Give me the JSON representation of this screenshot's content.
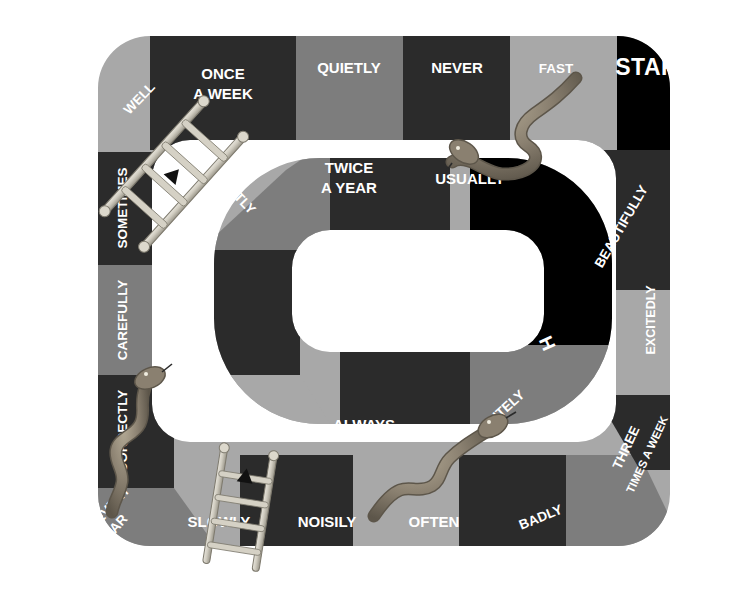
{
  "board": {
    "title": "Adverbs of Manner and Frequency Snakes and Ladders Board Game",
    "colors": {
      "dark": "#2b2b2b",
      "medium": "#7d7d7d",
      "light": "#a8a8a8",
      "black": "#000000",
      "text": "#ffffff",
      "background": "#ffffff",
      "snake_body": "#8a8070",
      "ladder": "#c8c4b8"
    },
    "start_label": "START",
    "finish_label": "FINISH"
  },
  "outer_track": {
    "top_row": [
      {
        "label": "WELL",
        "shade": "light"
      },
      {
        "label": "ONCE\nA WEEK",
        "shade": "dark"
      },
      {
        "label": "QUIETLY",
        "shade": "medium"
      },
      {
        "label": "NEVER",
        "shade": "dark"
      },
      {
        "label": "FAST",
        "shade": "light"
      },
      {
        "label": "START",
        "shade": "black"
      }
    ],
    "left_column": [
      {
        "label": "SOMETIMES",
        "shade": "dark"
      },
      {
        "label": "CAREFULLY",
        "shade": "medium"
      },
      {
        "label": "CORRECTLY",
        "shade": "dark"
      },
      {
        "label": "EVERY\nYEAR",
        "shade": "medium"
      }
    ],
    "bottom_row": [
      {
        "label": "SLOWLY",
        "shade": "dark"
      },
      {
        "label": "NOISILY",
        "shade": "light"
      },
      {
        "label": "OFTEN",
        "shade": "dark"
      },
      {
        "label": "BADLY",
        "shade": "medium"
      }
    ],
    "right_column": [
      {
        "label": "BEAUTIFULLY",
        "shade": "dark"
      },
      {
        "label": "EXCITEDLY",
        "shade": "light"
      },
      {
        "label": "THREE\nTIMES A WEEK",
        "shade": "dark"
      }
    ]
  },
  "inner_track": {
    "segments": [
      {
        "label": "SECRETLY",
        "shade": "medium"
      },
      {
        "label": "TWICE\nA YEAR",
        "shade": "dark"
      },
      {
        "label": "USUALLY",
        "shade": "light"
      },
      {
        "label": "ONCE\nA MONTH",
        "shade": "dark"
      },
      {
        "label": "CLEARLY",
        "shade": "light"
      },
      {
        "label": "ALWAYS",
        "shade": "dark"
      },
      {
        "label": "POLITELY",
        "shade": "medium"
      },
      {
        "label": "FINISH",
        "shade": "black"
      }
    ]
  },
  "pieces": {
    "ladders": [
      {
        "name": "ladder-secretly-to-well",
        "from": "SECRETLY",
        "to": "WELL",
        "arrow": "up-left"
      },
      {
        "name": "ladder-slowly-to-clearly",
        "from": "SLOWLY",
        "to": "CLEARLY",
        "arrow": "up"
      }
    ],
    "snakes": [
      {
        "name": "snake-fast-to-usually",
        "tail": "FAST",
        "head": "USUALLY"
      },
      {
        "name": "snake-once-a-month-to-every-year",
        "head": "ONCE A MONTH",
        "tail": "EVERY YEAR"
      },
      {
        "name": "snake-politely-to-often",
        "head": "POLITELY",
        "tail": "OFTEN"
      }
    ]
  },
  "text_labels": {
    "well": "WELL",
    "once_a_week_l1": "ONCE",
    "once_a_week_l2": "A WEEK",
    "quietly": "QUIETLY",
    "never": "NEVER",
    "fast": "FAST",
    "start": "START",
    "sometimes": "SOMETIMES",
    "carefully": "CAREFULLY",
    "correctly": "CORRECTLY",
    "every": "EVERY",
    "year": "YEAR",
    "slowly": "SLOWLY",
    "noisily": "NOISILY",
    "often": "OFTEN",
    "badly": "BADLY",
    "three": "THREE",
    "times_a_week": "TIMES A WEEK",
    "excitedly": "EXCITEDLY",
    "beautifully": "BEAUTIFULLY",
    "secretly": "SECRETLY",
    "twice": "TWICE",
    "a_year": "A YEAR",
    "usually": "USUALLY",
    "once": "ONCE",
    "a_month": "A MONTH",
    "clearly": "CLEARLY",
    "always": "ALWAYS",
    "politely": "POLITELY",
    "finish_f": "F",
    "finish_i": "I",
    "finish_n": "N",
    "finish_i2": "I",
    "finish_s": "S",
    "finish_h": "H"
  }
}
